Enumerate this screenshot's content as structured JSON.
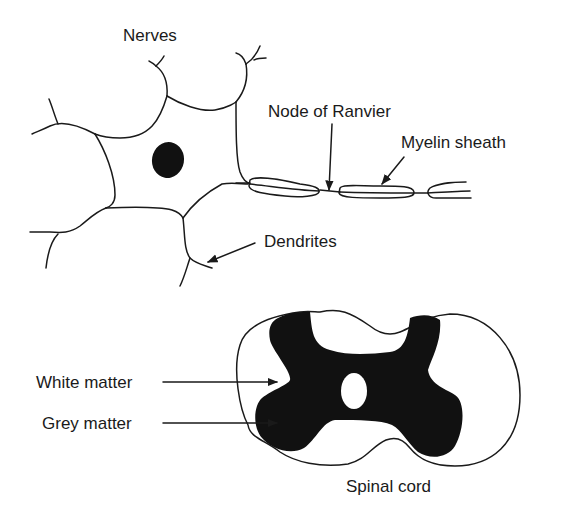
{
  "diagram": {
    "neuron": {
      "labels": {
        "nerves": "Nerves",
        "node_of_ranvier": "Node of Ranvier",
        "myelin_sheath": "Myelin sheath",
        "dendrites": "Dendrites"
      }
    },
    "spinal_cord": {
      "labels": {
        "white_matter": "White matter",
        "grey_matter": "Grey matter",
        "caption": "Spinal cord"
      }
    },
    "colors": {
      "line": "#1a1a1a",
      "fill": "#111111",
      "background": "#ffffff"
    }
  }
}
